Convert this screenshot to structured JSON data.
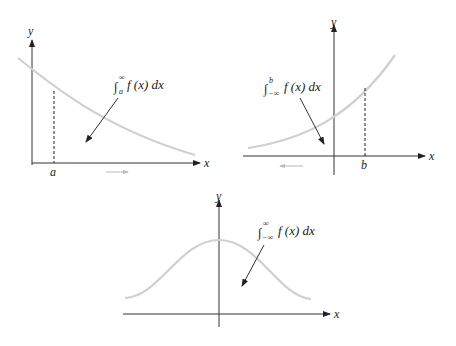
{
  "figures": [
    {
      "id": "right-tail",
      "y_axis_label": "y",
      "x_axis_label": "x",
      "bound_label": "a",
      "integral": {
        "symbol": "∫",
        "upper": "∞",
        "lower": "a",
        "integrand": "f (x) dx"
      },
      "direction_arrow": "right",
      "curve": "decreasing"
    },
    {
      "id": "left-tail",
      "y_axis_label": "y",
      "x_axis_label": "x",
      "bound_label": "b",
      "integral": {
        "symbol": "∫",
        "upper": "b",
        "lower": "−∞",
        "integrand": "f (x) dx"
      },
      "direction_arrow": "left",
      "curve": "increasing"
    },
    {
      "id": "full-line",
      "y_axis_label": "y",
      "x_axis_label": "x",
      "integral": {
        "symbol": "∫",
        "upper": "∞",
        "lower": "−∞",
        "integrand": "f (x) dx"
      },
      "curve": "bell"
    }
  ],
  "colors": {
    "curve": "#cfcfcf",
    "axis": "#333333",
    "direction_arrow": "#b8b8b8"
  }
}
